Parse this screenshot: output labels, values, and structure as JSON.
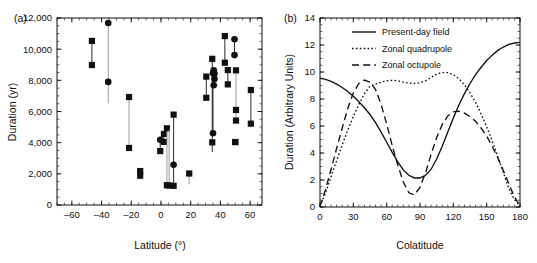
{
  "figure": {
    "panel_a_label": "(a)",
    "panel_b_label": "(b)"
  },
  "chart_data": [
    {
      "type": "scatter",
      "panel": "(a)",
      "title": "",
      "xlabel": "Latitude (°)",
      "ylabel": "Duration (yr)",
      "xlim": [
        -70,
        68
      ],
      "ylim": [
        0,
        12000
      ],
      "xticks": [
        -60,
        -40,
        -20,
        0,
        20,
        40,
        60
      ],
      "xticklabels": [
        "–60",
        "–40",
        "–20",
        "0",
        "20",
        "40",
        "60"
      ],
      "yticks": [
        0,
        2000,
        4000,
        6000,
        8000,
        10000,
        12000
      ],
      "yticklabels": [
        "0",
        "2,000",
        "4,000",
        "6,000",
        "8,000",
        "10,000",
        "12,000"
      ],
      "xminor_step": 5,
      "yminor_step": 500,
      "grid": false,
      "legend": "none",
      "marker_square": "filled-square",
      "marker_circle": "filled-circle",
      "series": [
        {
          "name": "Duration ranges with endpoint markers",
          "note": "Each entry: latitude, lower duration, upper duration, marker style of lower/upper endpoint, bar shade",
          "values": [
            {
              "lat": -46.5,
              "lo": 8980,
              "hi": 10530,
              "lo_marker": "square",
              "hi_marker": "square",
              "bar": "dark"
            },
            {
              "lat": -35.5,
              "lo": 6520,
              "hi": 11680,
              "lo_marker": "none",
              "hi_marker": "circle",
              "mid": 7900,
              "mid_marker": "circle",
              "bar": "light"
            },
            {
              "lat": -21.5,
              "lo": 3660,
              "hi": 6930,
              "lo_marker": "square",
              "hi_marker": "square",
              "bar": "light"
            },
            {
              "lat": -14.0,
              "lo": 1880,
              "hi": 2180,
              "lo_marker": "square",
              "hi_marker": "square",
              "bar": "dark"
            },
            {
              "lat": -0.5,
              "lo": 3460,
              "hi": 4180,
              "lo_marker": "square",
              "hi_marker": "circle",
              "bar": "dark"
            },
            {
              "lat": 2.0,
              "lo": 4050,
              "hi": 4560,
              "lo_marker": "square",
              "hi_marker": "square",
              "bar": "dark"
            },
            {
              "lat": 4.0,
              "lo": 1270,
              "hi": 4920,
              "lo_marker": "square",
              "hi_marker": "square",
              "bar": "light"
            },
            {
              "lat": 5.5,
              "lo": 1250,
              "hi": 4840,
              "lo_marker": "square",
              "hi_marker": "none",
              "bar": "light"
            },
            {
              "lat": 8.5,
              "lo": 1230,
              "hi": 5800,
              "lo_marker": "square",
              "hi_marker": "square",
              "mid": 2580,
              "mid_marker": "circle",
              "bar": "dark"
            },
            {
              "lat": 19.0,
              "lo": 1320,
              "hi": 2020,
              "lo_marker": "none",
              "hi_marker": "square",
              "bar": "light"
            },
            {
              "lat": 30.5,
              "lo": 6880,
              "hi": 8240,
              "lo_marker": "square",
              "hi_marker": "square",
              "bar": "dark"
            },
            {
              "lat": 34.5,
              "lo": 3400,
              "hi": 9380,
              "lo_marker": "none",
              "hi_marker": "square",
              "mid": 4020,
              "mid_marker": "square",
              "bar": "dark"
            },
            {
              "lat": 35.0,
              "lo": 4600,
              "hi": 8450,
              "lo_marker": "circle",
              "hi_marker": "circle",
              "bar": "dark"
            },
            {
              "lat": 35.5,
              "lo": 7680,
              "hi": 8650,
              "lo_marker": "circle",
              "hi_marker": "circle",
              "bar": "dark"
            },
            {
              "lat": 36.0,
              "lo": 8080,
              "hi": 8420,
              "lo_marker": "circle",
              "hi_marker": "circle",
              "bar": "dark"
            },
            {
              "lat": 43.0,
              "lo": 9130,
              "hi": 10840,
              "lo_marker": "square",
              "hi_marker": "square",
              "bar": "dark"
            },
            {
              "lat": 45.0,
              "lo": 7740,
              "hi": 8660,
              "lo_marker": "square",
              "hi_marker": "square",
              "bar": "dark"
            },
            {
              "lat": 49.5,
              "lo": 9620,
              "hi": 10640,
              "lo_marker": "circle",
              "hi_marker": "circle",
              "bar": "dark"
            },
            {
              "lat": 50.5,
              "lo": 5420,
              "hi": 8640,
              "lo_marker": "square",
              "hi_marker": "square",
              "mid": 6100,
              "mid_marker": "square",
              "bar": "light"
            },
            {
              "lat": 50.0,
              "lo": 4040,
              "hi": 4040,
              "lo_marker": "square",
              "hi_marker": "square",
              "bar": "none"
            },
            {
              "lat": 60.5,
              "lo": 5220,
              "hi": 7380,
              "lo_marker": "square",
              "hi_marker": "square",
              "bar": "dark"
            }
          ]
        }
      ]
    },
    {
      "type": "line",
      "panel": "(b)",
      "title": "",
      "xlabel": "Colatitude",
      "ylabel": "Duration (Arbitrary Units)",
      "xlim": [
        0,
        180
      ],
      "ylim": [
        0,
        14
      ],
      "xticks": [
        0,
        30,
        60,
        90,
        120,
        150,
        180
      ],
      "xticklabels": [
        "0",
        "30",
        "60",
        "90",
        "120",
        "150",
        "180"
      ],
      "yticks": [
        0,
        2,
        4,
        6,
        8,
        10,
        12,
        14
      ],
      "yticklabels": [
        "0",
        "2",
        "4",
        "6",
        "8",
        "10",
        "12",
        "14"
      ],
      "xminor_step": 5,
      "yminor_step": 0.5,
      "grid": false,
      "legend_position": "top-left",
      "x": [
        0,
        5,
        10,
        15,
        20,
        25,
        30,
        35,
        40,
        45,
        50,
        55,
        60,
        65,
        70,
        75,
        80,
        85,
        90,
        95,
        100,
        105,
        110,
        115,
        120,
        125,
        130,
        135,
        140,
        145,
        150,
        155,
        160,
        165,
        170,
        175,
        180
      ],
      "series": [
        {
          "name": "Present-day field",
          "style": "solid",
          "values": [
            9.55,
            9.45,
            9.3,
            9.1,
            8.85,
            8.55,
            8.2,
            7.8,
            7.35,
            6.85,
            6.25,
            5.55,
            4.8,
            4.05,
            3.35,
            2.75,
            2.35,
            2.15,
            2.15,
            2.35,
            2.8,
            3.55,
            4.5,
            5.55,
            6.6,
            7.55,
            8.4,
            9.15,
            9.8,
            10.35,
            10.85,
            11.25,
            11.6,
            11.85,
            12.05,
            12.15,
            12.2
          ]
        },
        {
          "name": "Zonal quadrupole",
          "style": "dotted",
          "values": [
            0.05,
            1.05,
            2.25,
            3.45,
            4.6,
            5.7,
            6.7,
            7.6,
            8.4,
            8.95,
            9.1,
            9.25,
            9.35,
            9.38,
            9.35,
            9.25,
            9.18,
            9.15,
            9.2,
            9.35,
            9.6,
            9.85,
            9.95,
            9.95,
            9.8,
            9.5,
            9.05,
            8.45,
            7.75,
            6.9,
            5.95,
            4.9,
            3.75,
            2.55,
            1.35,
            0.55,
            0.1
          ]
        },
        {
          "name": "Zonal octupole",
          "style": "dashed",
          "values": [
            0.05,
            1.3,
            2.8,
            4.35,
            5.85,
            7.3,
            8.45,
            9.15,
            9.4,
            9.25,
            8.7,
            7.6,
            6.15,
            4.55,
            3.1,
            1.85,
            1.05,
            0.9,
            1.45,
            2.55,
            3.9,
            5.15,
            6.1,
            6.75,
            7.05,
            7.1,
            6.95,
            6.7,
            6.35,
            5.85,
            5.25,
            4.5,
            3.65,
            2.7,
            1.7,
            0.75,
            0.05
          ]
        }
      ]
    }
  ]
}
